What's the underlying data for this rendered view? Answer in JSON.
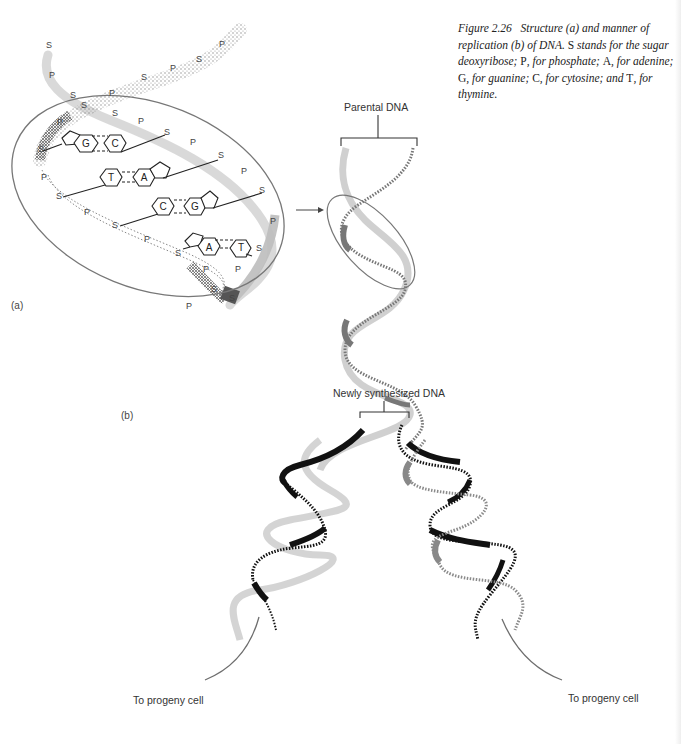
{
  "caption": {
    "figure_number": "Figure 2.26",
    "text_parts": [
      "Structure (",
      "a",
      ") and manner of replication (",
      "b",
      ") of DNA. ",
      "S",
      " stands for the sugar deoxyribose; ",
      "P",
      ", for phosphate; ",
      "A",
      ", for adenine; ",
      "G",
      ", for guanine; ",
      "C",
      ", for cytosine; and ",
      "T",
      ", for thymine."
    ]
  },
  "panels": {
    "a": "(a)",
    "b": "(b)"
  },
  "labels": {
    "parental_dna": "Parental DNA",
    "newly_synthesized_dna": "Newly synthesized DNA",
    "progeny_left": "To progeny cell",
    "progeny_right": "To progeny cell"
  },
  "helix_a": {
    "backbone_labels": [
      {
        "t": "S",
        "x": 49,
        "y": 48
      },
      {
        "t": "P",
        "x": 52,
        "y": 78
      },
      {
        "t": "S",
        "x": 73,
        "y": 98
      },
      {
        "t": "P",
        "x": 112,
        "y": 96
      },
      {
        "t": "S",
        "x": 84,
        "y": 108
      },
      {
        "t": "S",
        "x": 115,
        "y": 116
      },
      {
        "t": "P",
        "x": 60,
        "y": 125
      },
      {
        "t": "P",
        "x": 141,
        "y": 124
      },
      {
        "t": "S",
        "x": 144,
        "y": 80
      },
      {
        "t": "P",
        "x": 173,
        "y": 71
      },
      {
        "t": "S",
        "x": 199,
        "y": 62
      },
      {
        "t": "P",
        "x": 222,
        "y": 47
      },
      {
        "t": "S",
        "x": 167,
        "y": 135
      },
      {
        "t": "P",
        "x": 193,
        "y": 145
      },
      {
        "t": "S",
        "x": 221,
        "y": 158
      },
      {
        "t": "P",
        "x": 244,
        "y": 174
      },
      {
        "t": "S",
        "x": 262,
        "y": 193
      },
      {
        "t": "P",
        "x": 273,
        "y": 224
      },
      {
        "t": "S",
        "x": 259,
        "y": 251
      },
      {
        "t": "P",
        "x": 238,
        "y": 272
      },
      {
        "t": "S",
        "x": 41,
        "y": 152
      },
      {
        "t": "P",
        "x": 44,
        "y": 180
      },
      {
        "t": "S",
        "x": 59,
        "y": 199
      },
      {
        "t": "P",
        "x": 87,
        "y": 215
      },
      {
        "t": "S",
        "x": 115,
        "y": 228
      },
      {
        "t": "P",
        "x": 147,
        "y": 242
      },
      {
        "t": "S",
        "x": 178,
        "y": 256
      },
      {
        "t": "P",
        "x": 206,
        "y": 272
      },
      {
        "t": "S",
        "x": 214,
        "y": 292
      },
      {
        "t": "S",
        "x": 232,
        "y": 301
      },
      {
        "t": "P",
        "x": 189,
        "y": 309
      }
    ],
    "base_pairs": [
      {
        "left": "G",
        "right": "C"
      },
      {
        "left": "T",
        "right": "A"
      },
      {
        "left": "C",
        "right": "G"
      },
      {
        "left": "A",
        "right": "T"
      }
    ]
  },
  "colors": {
    "ink": "#222222",
    "ellipse": "#777777",
    "parental_strand": "#bdbdbd",
    "parental_strand_dark": "#7a7a7a",
    "new_strand": "#111111",
    "arrow": "#6e6e6e"
  }
}
